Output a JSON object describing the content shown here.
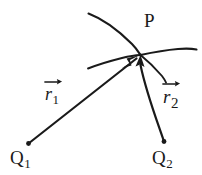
{
  "figure": {
    "background_color": "#ffffff",
    "ink_color": "#1a1a1a",
    "width": 202,
    "height": 175,
    "labels": {
      "point_p": "P",
      "charge_1": "Q",
      "charge_1_subscript": "1",
      "charge_2": "Q",
      "charge_2_subscript": "2",
      "vector_1": "r",
      "vector_1_subscript": "1",
      "vector_2": "r",
      "vector_2_subscript": "2"
    },
    "points": {
      "P": {
        "x": 140,
        "y": 55,
        "label": "P"
      },
      "Q1": {
        "x": 28,
        "y": 144,
        "label": "Q1"
      },
      "Q2": {
        "x": 164,
        "y": 142,
        "label": "Q2"
      }
    },
    "vectors": [
      {
        "name": "r1",
        "label": "r",
        "subscript": "1",
        "from": "Q1",
        "to": "P",
        "arrowhead": "at-P",
        "style": "straight"
      },
      {
        "name": "r2",
        "label": "r",
        "subscript": "2",
        "from": "Q2",
        "to": "P",
        "arrowhead": "at-P",
        "style": "slightly-curved"
      }
    ],
    "arcs": [
      {
        "name": "upper-arc-through-p",
        "description": "arc entering from upper left, passing through P and exiting to the right"
      },
      {
        "name": "lower-arc-through-p",
        "description": "shallow arc from left, rising into P"
      },
      {
        "name": "short-arc-below-p",
        "description": "short arc leaving P downward to the right"
      }
    ]
  }
}
